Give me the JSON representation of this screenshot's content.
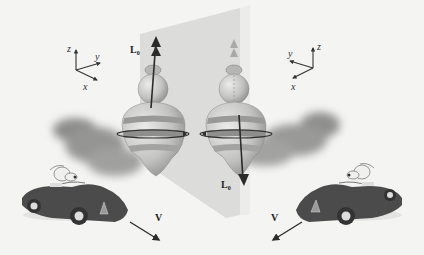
{
  "figure": {
    "colors": {
      "background": "#f4f4f2",
      "mirror_plane": "#d9d9d7",
      "shadow": "#9a9a98",
      "top_body": "#c4c4c2",
      "top_band_dark": "#8e8e8c",
      "arrow": "#2b2b2b",
      "car_body": "#4a4a4a"
    },
    "left_side": {
      "axes": {
        "z_label": "z",
        "y_label": "y",
        "x_label": "x"
      },
      "angular_momentum_label": "L",
      "angular_momentum_subscript": "0",
      "angular_momentum_direction": "up",
      "velocity_label": "V",
      "velocity_direction": "down-right"
    },
    "right_side": {
      "axes": {
        "z_label": "z",
        "y_label": "y",
        "x_label": "x"
      },
      "angular_momentum_label": "L",
      "angular_momentum_subscript": "0",
      "angular_momentum_direction": "down",
      "velocity_label": "V",
      "velocity_direction": "down-left"
    }
  }
}
